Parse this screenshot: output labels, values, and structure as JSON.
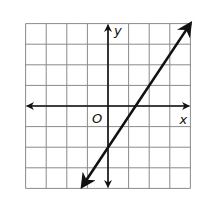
{
  "chart_data": {
    "type": "line",
    "title": "",
    "xlabel": "x",
    "ylabel": "y",
    "origin_label": "O",
    "xlim": [
      -4,
      4
    ],
    "ylim": [
      -4,
      4
    ],
    "grid": true,
    "grid_step": 1,
    "tick_labels": false,
    "series": [
      {
        "name": "line",
        "equation": "y = 1.5x - 2",
        "slope": 1.5,
        "y_intercept": -2,
        "x_intercept": 1.33,
        "points": [
          [
            -1.25,
            -3.9
          ],
          [
            0,
            -2
          ],
          [
            1.33,
            0
          ],
          [
            4,
            4
          ]
        ],
        "arrows": "both"
      }
    ]
  },
  "colors": {
    "grid": "#8a8a8a",
    "axis": "#111111",
    "line": "#111111",
    "background": "#ffffff"
  }
}
